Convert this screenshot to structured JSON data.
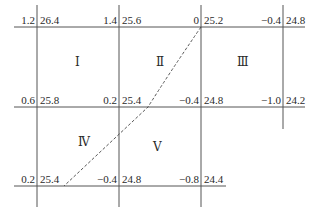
{
  "diagram": {
    "title": "",
    "grid_nodes": [
      {
        "id": "r0c0",
        "left_value": "1.2",
        "right_value": "26.4"
      },
      {
        "id": "r0c1",
        "left_value": "1.4",
        "right_value": "25.6"
      },
      {
        "id": "r0c2",
        "left_value": "0",
        "right_value": "25.2"
      },
      {
        "id": "r0c3",
        "left_value": "−0.4",
        "right_value": "24.8"
      },
      {
        "id": "r1c0",
        "left_value": "0.6",
        "right_value": "25.8"
      },
      {
        "id": "r1c1",
        "left_value": "0.2",
        "right_value": "25.4"
      },
      {
        "id": "r1c2",
        "left_value": "−0.4",
        "right_value": "24.8"
      },
      {
        "id": "r1c3",
        "left_value": "−1.0",
        "right_value": "24.2"
      },
      {
        "id": "r2c0",
        "left_value": "0.2",
        "right_value": "25.4"
      },
      {
        "id": "r2c1",
        "left_value": "−0.4",
        "right_value": "24.8"
      },
      {
        "id": "r2c2",
        "left_value": "−0.8",
        "right_value": "24.4"
      }
    ],
    "regions": [
      {
        "id": "I",
        "label": "Ⅰ"
      },
      {
        "id": "II",
        "label": "Ⅱ"
      },
      {
        "id": "III",
        "label": "Ⅲ"
      },
      {
        "id": "IV",
        "label": "Ⅳ"
      },
      {
        "id": "V",
        "label": "Ⅴ"
      }
    ],
    "line_color": "#555555",
    "dashed_line_description": "zero-contour boundary"
  }
}
